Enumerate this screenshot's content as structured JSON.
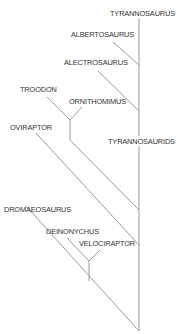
{
  "diagram": {
    "type": "cladogram",
    "colors": {
      "line": "#9a9a9a",
      "text": "#333333",
      "background": "#ffffff"
    },
    "labels": {
      "tyrannosaurus": "TYRANNOSAURUS",
      "albertosaurus": "ALBERTOSAURUS",
      "alectrosaurus": "ALECTROSAURUS",
      "troodon": "TROODON",
      "ornithomimus": "ORNITHOMIMUS",
      "oviraptor": "OVIRAPTOR",
      "tyrannosaurids": "TYRANNOSAURIDS",
      "dromaeosaurus": "DROMAEOSAURUS",
      "deinonychus": "DEINONYCHUS",
      "velociraptor": "VELOCIRAPTOR"
    }
  }
}
